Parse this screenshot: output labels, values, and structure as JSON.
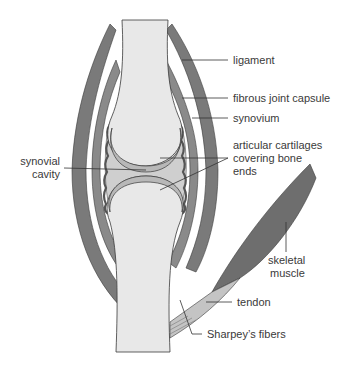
{
  "diagram": {
    "colors": {
      "bone": "#e8e8e8",
      "ligament": "#7a7a7a",
      "capsule": "#8a8a8a",
      "synovium": "#a8a8a8",
      "cavity": "#cfcfcf",
      "cartilage": "#b8b8b8",
      "muscle": "#6e6e6e",
      "tendon": "#c4c4c4",
      "outline": "#3a3a3a",
      "leader": "#333333"
    },
    "labels": {
      "ligament": "ligament",
      "fibrous_capsule": "fibrous joint capsule",
      "synovium": "synovium",
      "cartilage_1": "articular cartilages",
      "cartilage_2": "covering bone",
      "cartilage_3": "ends",
      "cavity_1": "synovial",
      "cavity_2": "cavity",
      "muscle_1": "skeletal",
      "muscle_2": "muscle",
      "tendon": "tendon",
      "sharpey": "Sharpey’s fibers"
    }
  }
}
